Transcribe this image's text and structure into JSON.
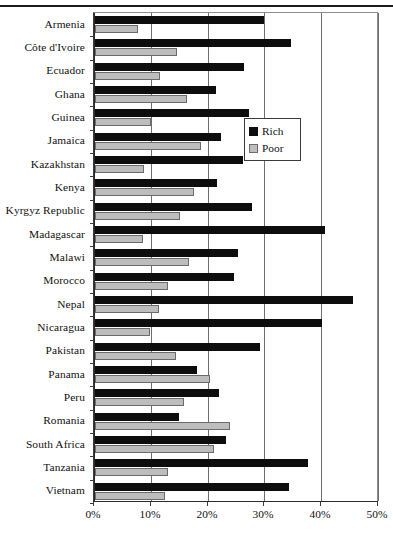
{
  "chart_data": {
    "type": "bar",
    "orientation": "horizontal",
    "title": "",
    "xlabel": "",
    "ylabel": "",
    "xlim": [
      0,
      50
    ],
    "xticks": [
      "0%",
      "10%",
      "20%",
      "30%",
      "40%",
      "50%"
    ],
    "xtick_values": [
      0,
      10,
      20,
      30,
      40,
      50
    ],
    "grid": true,
    "legend_position": "center-right",
    "categories": [
      "Armenia",
      "Côte d'Ivoire",
      "Ecuador",
      "Ghana",
      "Guinea",
      "Jamaica",
      "Kazakhstan",
      "Kenya",
      "Kyrgyz Republic",
      "Madagascar",
      "Malawi",
      "Morocco",
      "Nepal",
      "Nicaragua",
      "Pakistan",
      "Panama",
      "Peru",
      "Romania",
      "South Africa",
      "Tanzania",
      "Vietnam"
    ],
    "series": [
      {
        "name": "Rich",
        "color": "#0d0d0d",
        "values": [
          29.7,
          34.5,
          26.3,
          21.3,
          27.2,
          22.2,
          26.1,
          21.4,
          27.6,
          40.5,
          25.1,
          24.4,
          45.4,
          40.0,
          29.0,
          17.9,
          21.9,
          14.8,
          23.0,
          37.5,
          34.2
        ]
      },
      {
        "name": "Poor",
        "color": "#bdbdbd",
        "values": [
          7.5,
          14.4,
          11.4,
          16.2,
          9.8,
          18.6,
          8.6,
          17.5,
          15.0,
          8.5,
          16.6,
          12.8,
          11.2,
          9.6,
          14.2,
          20.2,
          15.7,
          23.8,
          21.0,
          12.9,
          12.3
        ]
      }
    ]
  },
  "legend": {
    "items": [
      {
        "label": "Rich",
        "swatch": "black-square-icon"
      },
      {
        "label": "Poor",
        "swatch": "gray-square-icon"
      }
    ]
  }
}
